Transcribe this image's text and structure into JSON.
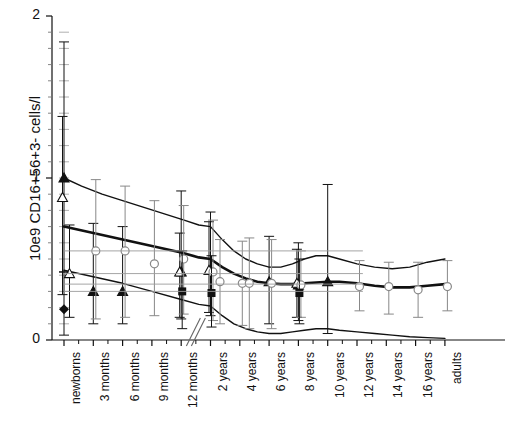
{
  "figure": {
    "type": "scatter-with-errorbars",
    "width": 514,
    "height": 427,
    "background": "#ffffff"
  },
  "axes": {
    "y_title": "10e9 CD16+56+3- cells/l",
    "y_ticks": [
      "0",
      "1",
      "2"
    ],
    "y_tick_values": [
      0,
      1,
      2
    ],
    "y_minor_count": 10,
    "ylim": [
      0,
      2
    ],
    "x_title": "",
    "x_ticks": [
      "newborns",
      "3 months",
      "6 months",
      "9 months",
      "12 months",
      "2 years",
      "4 years",
      "6 years",
      "8 years",
      "10 years",
      "12 years",
      "14 years",
      "16 years",
      "adults"
    ],
    "axis_break_between": [
      "12 months",
      "2 years"
    ],
    "axis_color": "#111111"
  },
  "chart_data": {
    "type": "scatter",
    "title": "",
    "xlabel": "",
    "ylabel": "10e9 CD16+56+3- cells/l",
    "ylim": [
      0,
      2
    ],
    "grid": false,
    "legend": "none",
    "categories": [
      "newborns",
      "3 months",
      "6 months",
      "9 months",
      "12 months",
      "2 years",
      "4 years",
      "6 years",
      "8 years",
      "10 years",
      "12 years",
      "14 years",
      "16 years",
      "adults"
    ],
    "reference_curves": [
      {
        "name": "upper-percentile",
        "style": "thin-solid",
        "points": [
          [
            0.0,
            1.0
          ],
          [
            0.06,
            0.95
          ],
          [
            0.13,
            0.9
          ],
          [
            0.2,
            0.86
          ],
          [
            0.27,
            0.82
          ],
          [
            0.34,
            0.78
          ],
          [
            0.41,
            0.74
          ],
          [
            0.46,
            0.71
          ],
          [
            0.5,
            0.7
          ],
          [
            0.54,
            0.62
          ],
          [
            0.58,
            0.55
          ],
          [
            0.62,
            0.5
          ],
          [
            0.66,
            0.47
          ],
          [
            0.7,
            0.45
          ],
          [
            0.74,
            0.45
          ],
          [
            0.78,
            0.47
          ],
          [
            0.82,
            0.5
          ],
          [
            0.86,
            0.52
          ],
          [
            0.9,
            0.52
          ],
          [
            0.94,
            0.5
          ],
          [
            1.0,
            0.47
          ],
          [
            1.06,
            0.45
          ],
          [
            1.12,
            0.44
          ],
          [
            1.18,
            0.45
          ],
          [
            1.24,
            0.48
          ],
          [
            1.3,
            0.5
          ]
        ]
      },
      {
        "name": "median",
        "style": "thick-solid",
        "points": [
          [
            0.0,
            0.7
          ],
          [
            0.1,
            0.66
          ],
          [
            0.2,
            0.62
          ],
          [
            0.3,
            0.58
          ],
          [
            0.4,
            0.54
          ],
          [
            0.46,
            0.51
          ],
          [
            0.5,
            0.5
          ],
          [
            0.54,
            0.45
          ],
          [
            0.58,
            0.41
          ],
          [
            0.62,
            0.38
          ],
          [
            0.66,
            0.36
          ],
          [
            0.7,
            0.35
          ],
          [
            0.74,
            0.345
          ],
          [
            0.78,
            0.345
          ],
          [
            0.82,
            0.35
          ],
          [
            0.86,
            0.355
          ],
          [
            0.9,
            0.36
          ],
          [
            0.94,
            0.36
          ],
          [
            1.0,
            0.35
          ],
          [
            1.06,
            0.335
          ],
          [
            1.12,
            0.325
          ],
          [
            1.18,
            0.325
          ],
          [
            1.24,
            0.335
          ],
          [
            1.3,
            0.345
          ]
        ]
      },
      {
        "name": "lower-percentile",
        "style": "thin-solid",
        "points": [
          [
            0.0,
            0.43
          ],
          [
            0.1,
            0.39
          ],
          [
            0.2,
            0.35
          ],
          [
            0.3,
            0.3
          ],
          [
            0.4,
            0.25
          ],
          [
            0.46,
            0.22
          ],
          [
            0.5,
            0.21
          ],
          [
            0.54,
            0.15
          ],
          [
            0.58,
            0.1
          ],
          [
            0.62,
            0.07
          ],
          [
            0.66,
            0.05
          ],
          [
            0.7,
            0.04
          ],
          [
            0.74,
            0.04
          ],
          [
            0.78,
            0.05
          ],
          [
            0.82,
            0.06
          ],
          [
            0.86,
            0.07
          ],
          [
            0.9,
            0.07
          ],
          [
            0.94,
            0.06
          ],
          [
            1.0,
            0.05
          ],
          [
            1.06,
            0.04
          ],
          [
            1.12,
            0.03
          ],
          [
            1.18,
            0.02
          ],
          [
            1.24,
            0.015
          ],
          [
            1.3,
            0.01
          ]
        ]
      }
    ],
    "series": [
      {
        "name": "filled-triangle",
        "marker": "triangle-up-filled",
        "color": "#111111",
        "points": [
          {
            "x": "newborns",
            "y": 1.0,
            "err_low": 0.42,
            "err_high": 1.84
          },
          {
            "x": "3 months",
            "y": 0.3,
            "err_low": 0.1,
            "err_high": 0.72
          },
          {
            "x": "6 months",
            "y": 0.3,
            "err_low": 0.1,
            "err_high": 0.7
          },
          {
            "x": "12 months",
            "y": 0.42,
            "err_low": 0.13,
            "err_high": 0.92
          },
          {
            "x": "2 years",
            "y": 0.43,
            "err_low": 0.15,
            "err_high": 0.79
          },
          {
            "x": "6 years",
            "y": 0.36,
            "err_low": 0.1,
            "err_high": 0.64
          },
          {
            "x": "8 years",
            "y": 0.34,
            "err_low": 0.12,
            "err_high": 0.6
          },
          {
            "x": "10 years",
            "y": 0.36,
            "err_low": 0.04,
            "err_high": 0.96
          }
        ]
      },
      {
        "name": "open-triangle",
        "marker": "triangle-up-open",
        "color": "#111111",
        "points": [
          {
            "x": "newborns",
            "y": 0.88,
            "err_low": 0.28,
            "err_high": 1.38
          },
          {
            "x": "newborns",
            "y": 0.41,
            "err_low": 0.14,
            "err_high": 0.71
          },
          {
            "x": "12 months",
            "y": 0.42,
            "err_low": 0.14,
            "err_high": 0.66
          },
          {
            "x": "2 years",
            "y": 0.43,
            "err_low": 0.17,
            "err_high": 0.73
          },
          {
            "x": "8 years",
            "y": 0.35,
            "err_low": 0.14,
            "err_high": 0.56
          }
        ]
      },
      {
        "name": "open-circle",
        "marker": "circle-open",
        "color": "#888888",
        "points": [
          {
            "x": "3 months",
            "y": 0.55,
            "err_low": 0.13,
            "err_high": 0.99
          },
          {
            "x": "6 months",
            "y": 0.55,
            "err_low": 0.14,
            "err_high": 0.95
          },
          {
            "x": "9 months",
            "y": 0.47,
            "err_low": 0.15,
            "err_high": 0.86
          },
          {
            "x": "12 months",
            "y": 0.5,
            "err_low": 0.16,
            "err_high": 0.83
          },
          {
            "x": "2 years",
            "y": 0.42,
            "err_low": 0.12,
            "err_high": 0.74
          },
          {
            "x": "2 years",
            "y": 0.36,
            "err_low": 0.1,
            "err_high": 0.62
          },
          {
            "x": "4 years",
            "y": 0.35,
            "err_low": 0.09,
            "err_high": 0.61
          },
          {
            "x": "4 years",
            "y": 0.35,
            "err_low": 0.07,
            "err_high": 0.63
          },
          {
            "x": "6 years",
            "y": 0.35,
            "err_low": 0.07,
            "err_high": 0.62
          },
          {
            "x": "8 years",
            "y": 0.34,
            "err_low": 0.14,
            "err_high": 0.55
          },
          {
            "x": "12 years",
            "y": 0.33,
            "err_low": 0.18,
            "err_high": 0.49
          },
          {
            "x": "14 years",
            "y": 0.33,
            "err_low": 0.16,
            "err_high": 0.48
          },
          {
            "x": "16 years",
            "y": 0.31,
            "err_low": 0.14,
            "err_high": 0.48
          },
          {
            "x": "adults",
            "y": 0.33,
            "err_low": 0.18,
            "err_high": 0.49
          }
        ]
      },
      {
        "name": "filled-square",
        "marker": "square-filled",
        "color": "#111111",
        "points": [
          {
            "x": "12 months",
            "y": 0.3,
            "err_low": 0.07,
            "err_high": 0.55
          },
          {
            "x": "2 years",
            "y": 0.29,
            "err_low": 0.08,
            "err_high": 0.52
          },
          {
            "x": "8 years",
            "y": 0.29,
            "err_low": 0.1,
            "err_high": 0.5
          }
        ]
      },
      {
        "name": "filled-diamond",
        "marker": "diamond-filled",
        "color": "#111111",
        "points": [
          {
            "x": "newborns",
            "y": 0.19,
            "err_low": 0.03,
            "err_high": 0.42
          }
        ]
      }
    ]
  }
}
